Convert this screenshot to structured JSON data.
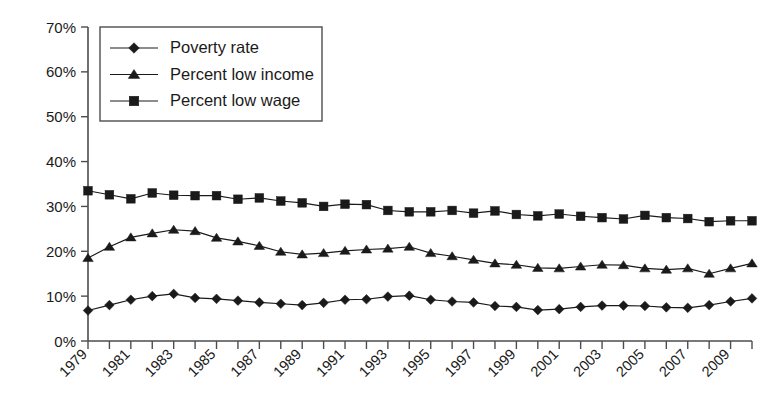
{
  "chart_data": {
    "type": "line",
    "title": "",
    "subtitle": "",
    "xlabel": "",
    "ylabel": "",
    "ylim": [
      0,
      70
    ],
    "xlim": [
      1979,
      2010
    ],
    "grid": false,
    "legend_position": "top-left",
    "y_ticks": [
      "0%",
      "10%",
      "20%",
      "30%",
      "40%",
      "50%",
      "60%",
      "70%"
    ],
    "y_tick_values": [
      0,
      10,
      20,
      30,
      40,
      50,
      60,
      70
    ],
    "x_tick_labels": [
      "1979",
      "1981",
      "1983",
      "1985",
      "1987",
      "1989",
      "1991",
      "1993",
      "1995",
      "1997",
      "1999",
      "2001",
      "2003",
      "2005",
      "2007",
      "2009"
    ],
    "x": [
      1979,
      1980,
      1981,
      1982,
      1983,
      1984,
      1985,
      1986,
      1987,
      1988,
      1989,
      1990,
      1991,
      1992,
      1993,
      1994,
      1995,
      1996,
      1997,
      1998,
      1999,
      2000,
      2001,
      2002,
      2003,
      2004,
      2005,
      2006,
      2007,
      2008,
      2009,
      2010
    ],
    "series": [
      {
        "name": "Poverty rate",
        "marker": "diamond",
        "values": [
          6.8,
          8.0,
          9.2,
          10.0,
          10.5,
          9.6,
          9.4,
          9.0,
          8.6,
          8.3,
          8.0,
          8.5,
          9.2,
          9.3,
          9.9,
          10.1,
          9.2,
          8.8,
          8.6,
          7.8,
          7.6,
          6.9,
          7.1,
          7.6,
          7.9,
          7.9,
          7.8,
          7.5,
          7.4,
          8.0,
          8.8,
          9.5
        ]
      },
      {
        "name": "Percent low income",
        "marker": "triangle",
        "values": [
          18.5,
          21.0,
          23.1,
          24.0,
          24.8,
          24.5,
          23.0,
          22.2,
          21.2,
          19.9,
          19.3,
          19.6,
          20.1,
          20.4,
          20.6,
          21.0,
          19.6,
          18.9,
          18.1,
          17.3,
          17.0,
          16.3,
          16.2,
          16.6,
          17.0,
          16.9,
          16.2,
          15.9,
          16.2,
          15.0,
          16.2,
          17.3
        ]
      },
      {
        "name": "Percent low wage",
        "marker": "square",
        "values": [
          33.5,
          32.6,
          31.7,
          33.0,
          32.5,
          32.4,
          32.4,
          31.6,
          31.9,
          31.2,
          30.8,
          30.0,
          30.5,
          30.4,
          29.1,
          28.8,
          28.8,
          29.1,
          28.5,
          29.0,
          28.2,
          27.9,
          28.3,
          27.8,
          27.5,
          27.2,
          28.0,
          27.5,
          27.3,
          26.6,
          26.8,
          26.8
        ]
      }
    ]
  },
  "legend": {
    "items": [
      {
        "label": "Poverty rate",
        "marker": "diamond"
      },
      {
        "label": "Percent low income",
        "marker": "triangle"
      },
      {
        "label": "Percent low wage",
        "marker": "square"
      }
    ]
  },
  "colors": {
    "ink": "#1a1a1a",
    "axis": "#4d4d4d",
    "background": "#ffffff"
  }
}
